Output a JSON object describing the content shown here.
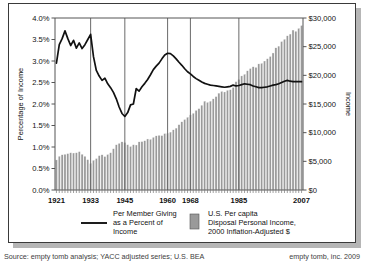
{
  "figure": {
    "footer_source": "Source: empty tomb analysis; YACC adjusted series; U.S. BEA",
    "footer_credit": "empty tomb, inc. 2009"
  },
  "axes": {
    "left_title": "Percentage of Income",
    "right_title": "Income",
    "left_ticks": [
      "0.0%",
      "0.5%",
      "1.0%",
      "1.5%",
      "2.0%",
      "2.5%",
      "3.0%",
      "3.5%",
      "4.0%"
    ],
    "right_ticks": [
      "$0",
      "$5,000",
      "$10,000",
      "$15,000",
      "$20,000",
      "$25,000",
      "$30,000"
    ],
    "x_ticks": [
      "1921",
      "1933",
      "1945",
      "1960",
      "1968",
      "1985",
      "2007"
    ]
  },
  "legend": {
    "line_label_line1": "Per Member Giving",
    "line_label_line2": "as a Percent of",
    "line_label_line3": "Income",
    "bar_label_line1": "U.S. Per capita",
    "bar_label_line2": "Disposal Personal Income,",
    "bar_label_line3": "2000 Inflation-Adjusted $"
  },
  "colors": {
    "bar_fill": "#9a9a9a",
    "line_stroke": "#111111",
    "grid": "#6a6a6a",
    "axis": "#555555",
    "shadow": "#b6b6b6"
  },
  "chart_data": {
    "type": "line",
    "title": "",
    "xlabel": "",
    "ylabel": "Percentage of Income",
    "y2label": "Income",
    "ylim": [
      0,
      4
    ],
    "y2lim": [
      0,
      30000
    ],
    "xlim": [
      1921,
      2007
    ],
    "grid": "vertical-only",
    "gridlines_x": [
      1933,
      1945,
      1960,
      1968,
      1985
    ],
    "legend_position": "below-plot",
    "x": [
      1921,
      1922,
      1923,
      1924,
      1925,
      1926,
      1927,
      1928,
      1929,
      1930,
      1931,
      1932,
      1933,
      1934,
      1935,
      1936,
      1937,
      1938,
      1939,
      1940,
      1941,
      1942,
      1943,
      1944,
      1945,
      1946,
      1947,
      1948,
      1949,
      1950,
      1951,
      1952,
      1953,
      1954,
      1955,
      1956,
      1957,
      1958,
      1959,
      1960,
      1961,
      1962,
      1963,
      1964,
      1965,
      1966,
      1967,
      1968,
      1969,
      1970,
      1971,
      1972,
      1973,
      1974,
      1975,
      1976,
      1977,
      1978,
      1979,
      1980,
      1981,
      1982,
      1983,
      1984,
      1985,
      1986,
      1987,
      1988,
      1989,
      1990,
      1991,
      1992,
      1993,
      1994,
      1995,
      1996,
      1997,
      1998,
      1999,
      2000,
      2001,
      2002,
      2003,
      2004,
      2005,
      2006,
      2007
    ],
    "series": [
      {
        "name": "Per Member Giving as a Percent of Income",
        "axis": "left",
        "unit": "percent",
        "type": "line",
        "values": [
          2.95,
          3.38,
          3.52,
          3.7,
          3.52,
          3.36,
          3.48,
          3.3,
          3.42,
          3.29,
          3.38,
          3.5,
          3.62,
          3.1,
          2.78,
          2.65,
          2.55,
          2.6,
          2.47,
          2.38,
          2.27,
          2.12,
          1.93,
          1.78,
          1.71,
          1.8,
          1.98,
          2.0,
          2.36,
          2.3,
          2.4,
          2.48,
          2.57,
          2.68,
          2.8,
          2.88,
          2.95,
          3.05,
          3.14,
          3.18,
          3.17,
          3.12,
          3.05,
          2.97,
          2.9,
          2.82,
          2.75,
          2.7,
          2.64,
          2.59,
          2.55,
          2.51,
          2.48,
          2.46,
          2.44,
          2.43,
          2.42,
          2.41,
          2.4,
          2.39,
          2.4,
          2.41,
          2.44,
          2.42,
          2.43,
          2.45,
          2.47,
          2.46,
          2.45,
          2.42,
          2.4,
          2.38,
          2.38,
          2.39,
          2.4,
          2.42,
          2.44,
          2.45,
          2.47,
          2.5,
          2.53,
          2.55,
          2.53,
          2.52,
          2.52,
          2.52,
          2.52
        ]
      },
      {
        "name": "U.S. Per capita Disposal Personal Income, 2000 Inflation-Adjusted $",
        "axis": "right",
        "unit": "dollars",
        "type": "bar",
        "values": [
          5250,
          5900,
          6150,
          6250,
          6350,
          6500,
          6450,
          6500,
          6700,
          6250,
          5900,
          5300,
          4650,
          5200,
          5500,
          6000,
          6150,
          5850,
          6200,
          6500,
          7200,
          7900,
          8150,
          8400,
          8300,
          7900,
          7600,
          7900,
          7850,
          8400,
          8450,
          8600,
          8900,
          8850,
          9200,
          9450,
          9550,
          9500,
          9850,
          9900,
          10100,
          10500,
          10800,
          11400,
          11900,
          12300,
          12700,
          13100,
          13400,
          13900,
          14200,
          14800,
          15500,
          15300,
          15500,
          15900,
          16300,
          16900,
          17200,
          17100,
          17400,
          17500,
          17900,
          18900,
          19300,
          19900,
          20200,
          20800,
          21200,
          21500,
          21400,
          22000,
          22100,
          22500,
          22900,
          23300,
          23900,
          24800,
          25100,
          25900,
          26300,
          26900,
          27200,
          27900,
          27700,
          28200,
          28700
        ]
      }
    ]
  }
}
